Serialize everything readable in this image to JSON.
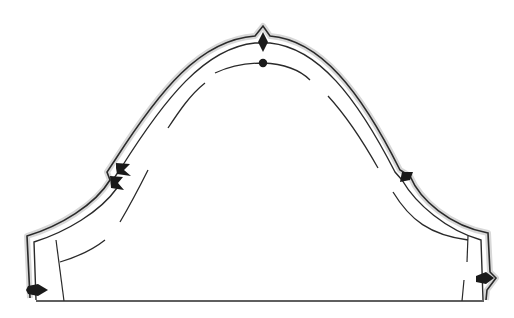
{
  "diagram": {
    "type": "sewing-pattern",
    "colors": {
      "background": "#ffffff",
      "outline": "#2a2a2a",
      "seam_allowance_fill": "#d8d8d8",
      "notch": "#1a1a1a"
    },
    "elements": {
      "cutting_line": "outer cutting line with seam allowance",
      "stitch_line": "inner stitching line",
      "ease_line": "dashed ease-stitching guide",
      "top_notch": "shoulder notch (single diamond)",
      "top_dot": "shoulder dot marker",
      "back_notch": "double notch (back armhole)",
      "front_notch": "single notch (front armhole)",
      "left_hem_notch": "left underarm notch",
      "right_hem_notch": "right underarm notch",
      "hem_line": "bottom hem line"
    }
  }
}
